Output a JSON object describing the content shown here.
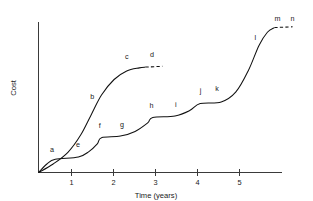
{
  "chart_data": {
    "type": "line",
    "title": "",
    "xlabel": "Time (years)",
    "ylabel": "Cost",
    "xlim": [
      0,
      5.8
    ],
    "ylim": [
      0,
      1.0
    ],
    "grid": false,
    "legend": null,
    "xticks": [
      1,
      2,
      3,
      4,
      5
    ],
    "xtick_labels": [
      "1",
      "2",
      "3",
      "4",
      "5"
    ],
    "yticks": [],
    "ytick_labels": [],
    "series": [
      {
        "name": "upper-curve",
        "style": "solid-with-dashed-plateau",
        "points": [
          {
            "x": 0.0,
            "y": 0.0
          },
          {
            "x": 0.35,
            "y": 0.055
          },
          {
            "x": 0.7,
            "y": 0.13
          },
          {
            "x": 1.0,
            "y": 0.24
          },
          {
            "x": 1.25,
            "y": 0.37
          },
          {
            "x": 1.5,
            "y": 0.5
          },
          {
            "x": 1.8,
            "y": 0.6
          },
          {
            "x": 2.1,
            "y": 0.655
          },
          {
            "x": 2.4,
            "y": 0.675
          },
          {
            "x": 2.55,
            "y": 0.68
          }
        ],
        "dashed_tail": [
          {
            "x": 2.55,
            "y": 0.68
          },
          {
            "x": 2.95,
            "y": 0.685
          }
        ]
      },
      {
        "name": "lower-staircase-curve",
        "style": "staircase-solid-risers-dashed-treads",
        "points": [
          {
            "x": 0.0,
            "y": 0.0
          },
          {
            "x": 0.2,
            "y": 0.055
          },
          {
            "x": 0.4,
            "y": 0.085
          },
          {
            "x": 0.95,
            "y": 0.1
          },
          {
            "x": 1.2,
            "y": 0.135
          },
          {
            "x": 1.4,
            "y": 0.185
          },
          {
            "x": 1.5,
            "y": 0.225
          },
          {
            "x": 1.95,
            "y": 0.235
          },
          {
            "x": 2.3,
            "y": 0.265
          },
          {
            "x": 2.6,
            "y": 0.32
          },
          {
            "x": 2.72,
            "y": 0.355
          },
          {
            "x": 3.25,
            "y": 0.365
          },
          {
            "x": 3.6,
            "y": 0.4
          },
          {
            "x": 3.85,
            "y": 0.445
          },
          {
            "x": 4.35,
            "y": 0.455
          },
          {
            "x": 4.7,
            "y": 0.52
          },
          {
            "x": 5.0,
            "y": 0.66
          },
          {
            "x": 5.25,
            "y": 0.82
          },
          {
            "x": 5.45,
            "y": 0.905
          },
          {
            "x": 5.62,
            "y": 0.935
          }
        ],
        "dashed_tail": [
          {
            "x": 5.62,
            "y": 0.935
          },
          {
            "x": 6.05,
            "y": 0.94
          }
        ]
      }
    ],
    "annotations": [
      {
        "label": "a",
        "x": 0.32,
        "y": 0.135,
        "series": "upper-curve"
      },
      {
        "label": "b",
        "x": 1.28,
        "y": 0.475,
        "series": "upper-curve"
      },
      {
        "label": "c",
        "x": 2.1,
        "y": 0.735,
        "series": "upper-curve"
      },
      {
        "label": "d",
        "x": 2.7,
        "y": 0.745,
        "series": "upper-curve"
      },
      {
        "label": "e",
        "x": 0.94,
        "y": 0.165,
        "series": "lower-staircase-curve"
      },
      {
        "label": "f",
        "x": 1.46,
        "y": 0.285,
        "series": "lower-staircase-curve"
      },
      {
        "label": "g",
        "x": 1.99,
        "y": 0.295,
        "series": "lower-staircase-curve"
      },
      {
        "label": "h",
        "x": 2.69,
        "y": 0.415,
        "series": "lower-staircase-curve"
      },
      {
        "label": "i",
        "x": 3.27,
        "y": 0.425,
        "series": "lower-staircase-curve"
      },
      {
        "label": "j",
        "x": 3.86,
        "y": 0.515,
        "series": "lower-staircase-curve"
      },
      {
        "label": "k",
        "x": 4.25,
        "y": 0.525,
        "series": "lower-staircase-curve"
      },
      {
        "label": "l",
        "x": 5.16,
        "y": 0.855,
        "series": "lower-staircase-curve"
      },
      {
        "label": "m",
        "x": 5.69,
        "y": 0.975,
        "series": "lower-staircase-curve"
      },
      {
        "label": "n",
        "x": 6.05,
        "y": 0.975,
        "series": "lower-staircase-curve"
      }
    ]
  }
}
